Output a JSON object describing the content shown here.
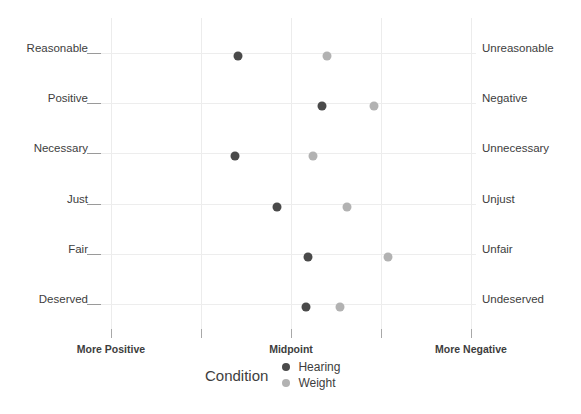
{
  "chart_data": {
    "type": "scatter",
    "title": "",
    "xlabel": "",
    "ylabel": "",
    "grid": true,
    "legend_position": "bottom",
    "legend_title": "Condition",
    "xlim": [
      -2,
      2
    ],
    "x_tick_values": [
      -2,
      -1,
      0,
      1,
      2
    ],
    "x_tick_labels": [
      "More Positive",
      "",
      "Midpoint",
      "",
      "More Negative"
    ],
    "categories": [
      "Reasonable",
      "Positive",
      "Necessary",
      "Just",
      "Fair",
      "Deserved"
    ],
    "categories_right": [
      "Unreasonable",
      "Negative",
      "Unnecessary",
      "Unjust",
      "Unfair",
      "Undeserved"
    ],
    "series": [
      {
        "name": "Hearing",
        "color": "#4a4a4a",
        "values": [
          -0.59,
          0.34,
          -0.62,
          -0.16,
          0.19,
          0.17
        ]
      },
      {
        "name": "Weight",
        "color": "#b2b2b2",
        "values": [
          0.4,
          0.92,
          0.24,
          0.62,
          1.08,
          0.54
        ]
      }
    ]
  },
  "axis": {
    "tick_labels": [
      {
        "label": "More Positive",
        "value": -2
      },
      {
        "label": "",
        "value": -1
      },
      {
        "label": "Midpoint",
        "value": 0
      },
      {
        "label": "",
        "value": 1
      },
      {
        "label": "More Negative",
        "value": 2
      }
    ]
  },
  "rows": [
    {
      "left": "Reasonable",
      "right": "Unreasonable",
      "hearing": -0.59,
      "weight": 0.4
    },
    {
      "left": "Positive",
      "right": "Negative",
      "hearing": 0.34,
      "weight": 0.92
    },
    {
      "left": "Necessary",
      "right": "Unnecessary",
      "hearing": -0.62,
      "weight": 0.24
    },
    {
      "left": "Just",
      "right": "Unjust",
      "hearing": -0.16,
      "weight": 0.62
    },
    {
      "left": "Fair",
      "right": "Unfair",
      "hearing": 0.19,
      "weight": 1.08
    },
    {
      "left": "Deserved",
      "right": "Undeserved",
      "hearing": 0.17,
      "weight": 0.54
    }
  ],
  "legend": {
    "title": "Condition",
    "items": [
      {
        "label": "Hearing",
        "color": "#4a4a4a"
      },
      {
        "label": "Weight",
        "color": "#b2b2b2"
      }
    ]
  },
  "colors": {
    "hearing": "#4a4a4a",
    "weight": "#b2b2b2",
    "grid": "#ececec",
    "text": "#3d3d3d",
    "background": "#ffffff"
  }
}
